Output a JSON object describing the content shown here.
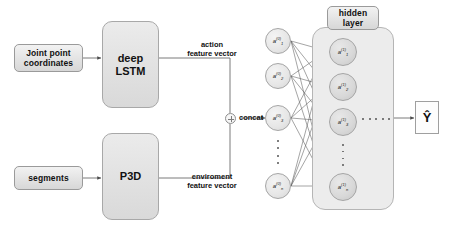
{
  "diagram": {
    "accent_color": "#e2e2e2",
    "line_color": "#6b6b6b"
  },
  "inputs": [
    {
      "id": "joint-point-coordinates",
      "label": "Joint point\ncoordinates",
      "line1": "Joint point",
      "line2": "coordinates"
    },
    {
      "id": "segments",
      "label": "segments",
      "line1": "segments",
      "line2": ""
    }
  ],
  "processors": [
    {
      "id": "deep-lstm",
      "line1": "deep",
      "line2": "LSTM"
    },
    {
      "id": "p3d",
      "line1": "P3D",
      "line2": ""
    }
  ],
  "edge_labels": [
    {
      "id": "action-feature-vector",
      "line1": "action",
      "line2": "feature vector"
    },
    {
      "id": "enviroment-feature-vector",
      "line1": "enviroment",
      "line2": "feature vector"
    }
  ],
  "concat": {
    "label": "concat",
    "symbol": "+"
  },
  "network": {
    "hidden_layer_tag": {
      "line1": "hidden",
      "line2": "layer"
    },
    "input_nodes": [
      {
        "base": "a",
        "sup": "(0)",
        "sub": "1"
      },
      {
        "base": "a",
        "sup": "(0)",
        "sub": "2"
      },
      {
        "base": "a",
        "sup": "(0)",
        "sub": "3"
      },
      {
        "base": "a",
        "sup": "(0)",
        "sub": "n"
      }
    ],
    "hidden_nodes": [
      {
        "base": "a",
        "sup": "(1)",
        "sub": "1"
      },
      {
        "base": "a",
        "sup": "(1)",
        "sub": "2"
      },
      {
        "base": "a",
        "sup": "(1)",
        "sub": "3"
      },
      {
        "base": "a",
        "sup": "(1)",
        "sub": "n"
      }
    ],
    "ellipsis_between_layers": "· · · · ·"
  },
  "output": {
    "id": "y-hat",
    "label": "Ŷ"
  }
}
